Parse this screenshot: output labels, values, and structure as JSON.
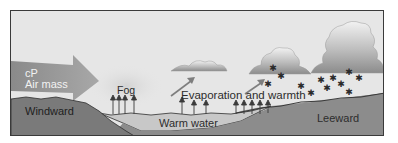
{
  "diagram": {
    "title": "",
    "labels": {
      "air_mass_line1": "cP",
      "air_mass_line2": "Air mass",
      "fog": "Fog",
      "evaporation": "Evaporation and warmth",
      "windward": "Windward",
      "warm_water": "Warm water",
      "leeward": "Leeward"
    },
    "colors": {
      "sky": "#e6e6e6",
      "land_dark": "#7a7a7a",
      "land_leeward": "#9e9e9e",
      "water": "#c4c4c4",
      "arrow": "#8f8f8f",
      "cloud": "#b0b0b0",
      "snow": "#2a2a2a",
      "outline": "#3a3a3a"
    },
    "elements": {
      "clouds": [
        "small-flat-cloud",
        "medium-cloud",
        "large-cumulus-cloud"
      ],
      "snowflakes_count": 12,
      "steam_arrows_count": 12
    }
  }
}
